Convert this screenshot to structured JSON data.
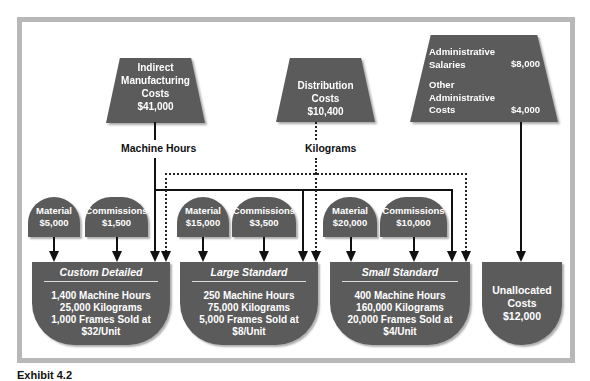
{
  "diagram": {
    "cost_pools": {
      "indirect": {
        "lines": [
          "Indirect",
          "Manufacturing",
          "Costs",
          "$41,000"
        ]
      },
      "distribution": {
        "lines": [
          "Distribution",
          "Costs",
          "$10,400"
        ]
      },
      "administrative": {
        "salaries_label_1": "Administrative",
        "salaries_label_2": "Salaries",
        "salaries_value": "$8,000",
        "other_label_1": "Other",
        "other_label_2": "Administrative",
        "other_label_3": "Costs",
        "other_value": "$4,000"
      }
    },
    "drivers": {
      "machine_hours": "Machine Hours",
      "kilograms": "Kilograms"
    },
    "direct_costs": [
      {
        "product": "Custom Detailed",
        "material_label": "Material",
        "material_value": "$5,000",
        "commissions_label": "Commissions",
        "commissions_value": "$1,500"
      },
      {
        "product": "Large Standard",
        "material_label": "Material",
        "material_value": "$15,000",
        "commissions_label": "Commissions",
        "commissions_value": "$3,500"
      },
      {
        "product": "Small Standard",
        "material_label": "Material",
        "material_value": "$20,000",
        "commissions_label": "Commissions",
        "commissions_value": "$10,000"
      }
    ],
    "products": [
      {
        "name": "Custom Detailed",
        "lines": [
          "1,400 Machine Hours",
          "25,000 Kilograms",
          "1,000 Frames Sold at",
          "$32/Unit"
        ]
      },
      {
        "name": "Large Standard",
        "lines": [
          "250 Machine Hours",
          "75,000 Kilograms",
          "5,000 Frames Sold at",
          "$8/Unit"
        ]
      },
      {
        "name": "Small Standard",
        "lines": [
          "400 Machine Hours",
          "160,000 Kilograms",
          "20,000 Frames Sold at",
          "$4/Unit"
        ]
      }
    ],
    "unallocated": {
      "lines": [
        "Unallocated",
        "Costs",
        "$12,000"
      ]
    },
    "colors": {
      "shape_fill": "#5b5b5b",
      "frame_border": "#b8b8b8",
      "text_on_shape": "#ffffff"
    }
  },
  "caption": "Exhibit 4.2"
}
